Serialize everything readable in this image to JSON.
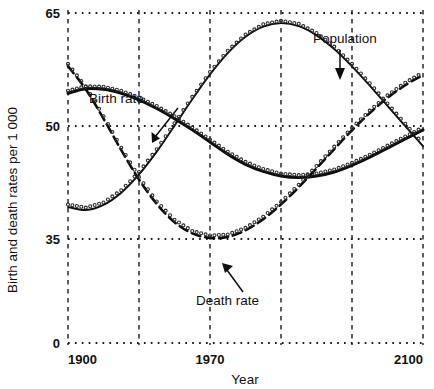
{
  "chart_data": {
    "type": "line",
    "title": "",
    "xlabel": "Year",
    "ylabel": "Birth and death rates per 1 000",
    "xlim": [
      1900,
      2100
    ],
    "ylim": [
      0,
      65
    ],
    "grid": true,
    "legend_position": "inline-annotations",
    "y_ticks": [
      0,
      35,
      50,
      65
    ],
    "y_tick_labels": [
      "0",
      "35",
      "50",
      "65"
    ],
    "x_ticks": [
      1900,
      1935,
      1970,
      2005,
      2040,
      2100
    ],
    "x_tick_labels": [
      "1900",
      "",
      "1970",
      "",
      "",
      "2100"
    ],
    "x_labeled_ticks": [
      {
        "value": 1900,
        "label": "1900"
      },
      {
        "value": 1970,
        "label": "1970"
      },
      {
        "value": 2100,
        "label": "2100"
      }
    ],
    "annotations": [
      {
        "text": "Birth rate",
        "series": "Birth rate",
        "x": 1945,
        "y": 47
      },
      {
        "text": "Population",
        "series": "Population",
        "x": 2035,
        "y": 60
      },
      {
        "text": "Death rate",
        "series": "Death rate",
        "x": 2020,
        "y": 18
      }
    ],
    "series": [
      {
        "name": "Birth rate",
        "style": "solid-thick",
        "x": [
          1900,
          1910,
          1920,
          1930,
          1940,
          1950,
          1960,
          1970,
          1980,
          1990,
          2000,
          2010,
          2020,
          2030,
          2040,
          2050,
          2060,
          2070,
          2080,
          2090,
          2100
        ],
        "values": [
          49.2,
          50.1,
          50.0,
          49.2,
          47.9,
          46.2,
          44.2,
          42.0,
          39.6,
          37.2,
          35.2,
          33.8,
          32.9,
          32.6,
          32.9,
          33.7,
          35.0,
          36.6,
          38.4,
          40.2,
          42.0
        ]
      },
      {
        "name": "Death rate",
        "style": "dashed",
        "x": [
          1900,
          1910,
          1920,
          1930,
          1940,
          1950,
          1960,
          1970,
          1980,
          1990,
          2000,
          2010,
          2020,
          2030,
          2040,
          2050,
          2060,
          2070,
          2080,
          2090,
          2100
        ],
        "values": [
          54.5,
          50.0,
          44.2,
          38.0,
          32.2,
          27.4,
          23.8,
          21.6,
          20.7,
          20.9,
          22.2,
          24.4,
          27.3,
          30.7,
          34.4,
          38.2,
          41.9,
          45.3,
          48.3,
          50.8,
          52.8
        ]
      },
      {
        "name": "Population",
        "style": "solid-thin",
        "x": [
          1900,
          1910,
          1920,
          1930,
          1940,
          1950,
          1960,
          1970,
          1980,
          1990,
          2000,
          2010,
          2020,
          2030,
          2040,
          2050,
          2060,
          2070,
          2080,
          2090,
          2100
        ],
        "values": [
          26.8,
          26.2,
          27.2,
          29.6,
          33.2,
          37.7,
          42.8,
          48.0,
          52.9,
          57.1,
          60.3,
          62.3,
          63.0,
          62.4,
          60.6,
          57.9,
          54.5,
          50.7,
          46.7,
          42.7,
          38.8
        ]
      }
    ]
  },
  "axis": {
    "y_title": "Birth and death rates per 1 000",
    "x_title": "Year"
  },
  "labels": {
    "birth_rate": "Birth rate",
    "population": "Population",
    "death_rate": "Death rate"
  }
}
